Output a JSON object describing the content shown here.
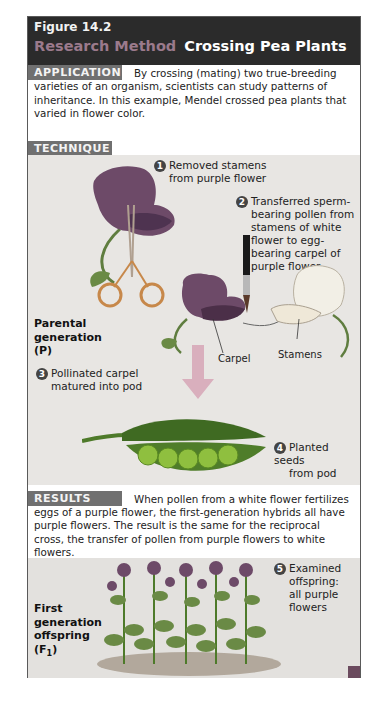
{
  "figure": {
    "number": "Figure 14.2",
    "category": "Research Method",
    "title": "Crossing Pea Plants"
  },
  "application": {
    "label": "APPLICATION",
    "text_first": "By crossing (mating) two true-breeding",
    "text_rest": "varieties of an organism, scientists can study patterns of inheritance. In this example, Mendel crossed pea plants that varied in flower color."
  },
  "technique": {
    "label": "TECHNIQUE",
    "steps": [
      {
        "num": "1",
        "text_lines": [
          "Removed stamens",
          "from purple flower"
        ]
      },
      {
        "num": "2",
        "text_lines": [
          "Transferred sperm-",
          "bearing pollen from",
          "stamens of white",
          "flower to egg-",
          "bearing carpel of",
          "purple flower"
        ]
      },
      {
        "num": "3",
        "text_lines": [
          "Pollinated carpel",
          "matured into pod"
        ]
      },
      {
        "num": "4",
        "text_lines": [
          "Planted seeds",
          "from pod"
        ]
      }
    ],
    "generation_label_lines": [
      "Parental",
      "generation",
      "(P)"
    ],
    "carpel_label": "Carpel",
    "stamens_label": "Stamens"
  },
  "results": {
    "label": "RESULTS",
    "text_first": "When pollen from a white flower fertilizes",
    "text_rest": "eggs of a purple flower, the first-generation hybrids all have purple flowers. The result is the same for the reciprocal cross, the transfer of pollen from purple flowers to white flowers.",
    "step": {
      "num": "5",
      "text_lines": [
        "Examined",
        "offspring:",
        "all purple",
        "flowers"
      ]
    },
    "generation_label_lines": [
      "First",
      "generation",
      "offspring",
      "(F",
      "1",
      ")"
    ]
  },
  "colors": {
    "header_bg": "#2b2b2b",
    "category_text": "#9b7a8c",
    "label_bg": "#707070",
    "panel_bg": "#e8e6e3",
    "purple_flower": "#6d4a68",
    "white_flower": "#f2efe6",
    "leaf_green": "#5f7d3f",
    "pea_green": "#8fbf3f"
  }
}
